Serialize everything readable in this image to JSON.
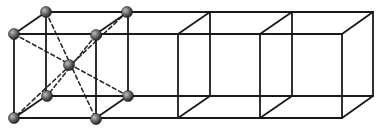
{
  "diagram": {
    "caption": "BCC unit cell repeated along a row",
    "colors": {
      "edge": "#1a1a1a",
      "dashed": "#2a2a2a",
      "atom_light": "#9a9a9a",
      "atom_dark": "#2e2e2e",
      "background": "#ffffff"
    },
    "cells": [
      {
        "id": "cell-1",
        "front_x": 14,
        "back_x": 46,
        "has_atoms": true
      },
      {
        "id": "cell-2",
        "front_x": 96,
        "back_x": 128,
        "has_atoms": false
      },
      {
        "id": "cell-3",
        "front_x": 178,
        "back_x": 210,
        "has_atoms": false
      },
      {
        "id": "cell-4",
        "front_x": 260,
        "back_x": 292,
        "has_atoms": false
      }
    ],
    "end_x": {
      "front": 342,
      "back": 373
    },
    "y": {
      "front_top": 34,
      "front_bottom": 118,
      "back_top": 12,
      "back_bottom": 96
    },
    "atoms": [
      {
        "name": "corner-front-top-left",
        "x": 14,
        "y": 34
      },
      {
        "name": "corner-back-top-left",
        "x": 46,
        "y": 12
      },
      {
        "name": "corner-back-top-right",
        "x": 127,
        "y": 12
      },
      {
        "name": "corner-front-top-right",
        "x": 96,
        "y": 35
      },
      {
        "name": "corner-back-bottom-left",
        "x": 47,
        "y": 96
      },
      {
        "name": "corner-back-bottom-right",
        "x": 128,
        "y": 96
      },
      {
        "name": "corner-front-bottom-left",
        "x": 14,
        "y": 118
      },
      {
        "name": "corner-front-bottom-right",
        "x": 96,
        "y": 119
      },
      {
        "name": "body-center",
        "x": 69,
        "y": 65
      }
    ]
  }
}
